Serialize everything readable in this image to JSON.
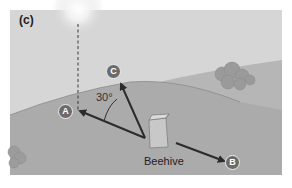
{
  "figure": {
    "panel_label": "(c)",
    "angle_label": "30°",
    "hive_label": "Beehive",
    "markers": {
      "a": "A",
      "b": "B",
      "c": "C"
    },
    "colors": {
      "sky": "#d6d6d6",
      "hill_back": "#b4b4b4",
      "hill_front": "#a9a9a9",
      "arrow": "#2b2b2b",
      "badge": "#6b6b6b"
    }
  }
}
